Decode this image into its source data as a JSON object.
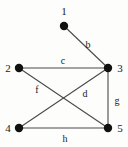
{
  "figure": {
    "background_color": "#fdfdfc",
    "ink_color": "#1a1a1a",
    "edge_color": "#4a4a4a",
    "width": 128,
    "height": 147
  },
  "graph": {
    "vertices": [
      {
        "id": "1",
        "label": "1",
        "cx": 64,
        "cy": 26,
        "r": 4.2,
        "label_x": 64,
        "label_y": 11
      },
      {
        "id": "2",
        "label": "2",
        "cx": 19,
        "cy": 68,
        "r": 4.2,
        "label_x": 8,
        "label_y": 68
      },
      {
        "id": "3",
        "label": "3",
        "cx": 108,
        "cy": 68,
        "r": 4.2,
        "label_x": 120,
        "label_y": 68
      },
      {
        "id": "4",
        "label": "4",
        "cx": 19,
        "cy": 128,
        "r": 4.2,
        "label_x": 8,
        "label_y": 128
      },
      {
        "id": "5",
        "label": "5",
        "cx": 108,
        "cy": 128,
        "r": 4.2,
        "label_x": 120,
        "label_y": 128
      }
    ],
    "edges": [
      {
        "id": "b",
        "label": "b",
        "from": "1",
        "to": "3",
        "x1": 64,
        "y1": 26,
        "x2": 108,
        "y2": 68,
        "label_x": 88,
        "label_y": 44
      },
      {
        "id": "c",
        "label": "c",
        "from": "2",
        "to": "3",
        "x1": 19,
        "y1": 68,
        "x2": 108,
        "y2": 68,
        "label_x": 63,
        "label_y": 60
      },
      {
        "id": "f",
        "label": "f",
        "from": "2",
        "to": "5",
        "x1": 19,
        "y1": 68,
        "x2": 108,
        "y2": 128,
        "label_x": 37,
        "label_y": 89
      },
      {
        "id": "d",
        "label": "d",
        "from": "3",
        "to": "4",
        "x1": 108,
        "y1": 68,
        "x2": 19,
        "y2": 128,
        "label_x": 85,
        "label_y": 93
      },
      {
        "id": "g",
        "label": "g",
        "from": "3",
        "to": "5",
        "x1": 108,
        "y1": 68,
        "x2": 108,
        "y2": 128,
        "label_x": 117,
        "label_y": 100
      },
      {
        "id": "h",
        "label": "h",
        "from": "4",
        "to": "5",
        "x1": 19,
        "y1": 128,
        "x2": 108,
        "y2": 128,
        "label_x": 65,
        "label_y": 138
      }
    ]
  }
}
